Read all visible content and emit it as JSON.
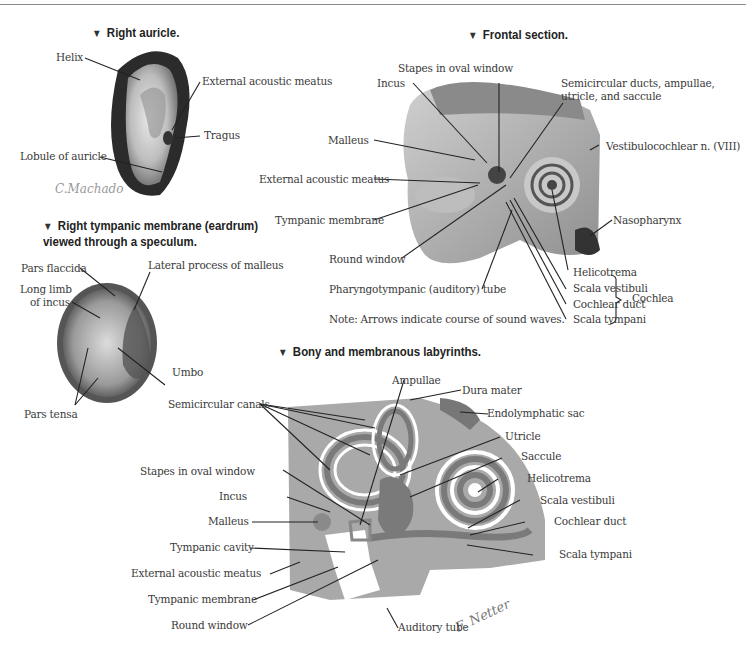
{
  "figures": {
    "right_auricle": {
      "title": "Right auricle.",
      "labels": {
        "helix": "Helix",
        "external_acoustic_meatus": "External acoustic meatus",
        "tragus": "Tragus",
        "lobule": "Lobule of auricle"
      },
      "signature": "C.Machado"
    },
    "tympanic_membrane": {
      "title_line1": "Right tympanic membrane (eardrum)",
      "title_line2": "viewed through a speculum.",
      "labels": {
        "pars_flaccida": "Pars flaccida",
        "long_limb_line1": "Long limb",
        "long_limb_line2": "of incus",
        "lateral_process": "Lateral process of malleus",
        "umbo": "Umbo",
        "pars_tensa": "Pars tensa"
      }
    },
    "frontal_section": {
      "title": "Frontal section.",
      "labels": {
        "stapes": "Stapes in oval  window",
        "incus": "Incus",
        "semicircular_line1": "Semicircular ducts, ampullae,",
        "semicircular_line2": "utricle, and saccule",
        "malleus": "Malleus",
        "vestibulocochlear": "Vestibulocochlear n. (VIII)",
        "external_acoustic_meatus": "External acoustic meatus",
        "tympanic_membrane": "Tympanic membrane",
        "nasopharynx": "Nasopharynx",
        "round_window": "Round window",
        "pharyngotympanic": "Pharyngotympanic (auditory) tube",
        "helicotrema": "Helicotrema",
        "scala_vestibuli": "Scala vestibuli",
        "cochlear_duct": "Cochlear duct",
        "scala_tympani": "Scala tympani",
        "cochlea": "Cochlea"
      },
      "note": "Note: Arrows indicate course of sound waves."
    },
    "labyrinths": {
      "title": "Bony and membranous labyrinths.",
      "labels": {
        "ampullae": "Ampullae",
        "dura_mater": "Dura mater",
        "semicircular_canals": "Semicircular canals",
        "endolymphatic_sac": "Endolymphatic sac",
        "utricle": "Utricle",
        "saccule": "Saccule",
        "stapes": "Stapes in oval window",
        "helicotrema": "Helicotrema",
        "incus": "Incus",
        "scala_vestibuli": "Scala vestibuli",
        "malleus": "Malleus",
        "cochlear_duct": "Cochlear duct",
        "tympanic_cavity": "Tympanic cavity",
        "scala_tympani": "Scala tympani",
        "external_acoustic_meatus": "External acoustic meatus",
        "tympanic_membrane": "Tympanic membrane",
        "round_window": "Round window",
        "auditory_tube": "Auditory tube"
      },
      "signature": "F. Netter"
    }
  },
  "colors": {
    "bone": "#a8a8a8",
    "membranous": "#7a7a7a",
    "perilymph": "#ffffff",
    "text": "#3a3a3a"
  }
}
